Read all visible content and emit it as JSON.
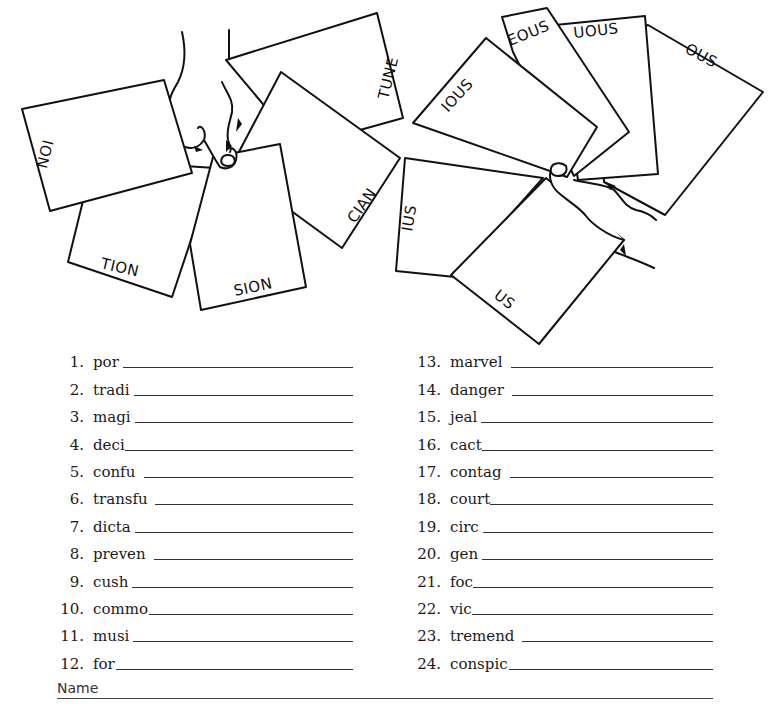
{
  "illustration": {
    "left_hand_cards": [
      "ION",
      "TION",
      "SION",
      "CIAN",
      "TUNE"
    ],
    "right_hand_cards": [
      "IOUS",
      "EOUS",
      "UOUS",
      "OUS",
      "IUS",
      "US"
    ]
  },
  "exercise": {
    "left_column": [
      {
        "num": "1.",
        "stem": "por"
      },
      {
        "num": "2.",
        "stem": "tradi"
      },
      {
        "num": "3.",
        "stem": "magi"
      },
      {
        "num": "4.",
        "stem": "deci"
      },
      {
        "num": "5.",
        "stem": "confu"
      },
      {
        "num": "6.",
        "stem": "transfu"
      },
      {
        "num": "7.",
        "stem": "dicta"
      },
      {
        "num": "8.",
        "stem": "preven"
      },
      {
        "num": "9.",
        "stem": "cush"
      },
      {
        "num": "10.",
        "stem": "commo"
      },
      {
        "num": "11.",
        "stem": "musi"
      },
      {
        "num": "12.",
        "stem": "for"
      }
    ],
    "right_column": [
      {
        "num": "13.",
        "stem": "marvel"
      },
      {
        "num": "14.",
        "stem": "danger"
      },
      {
        "num": "15.",
        "stem": "jeal"
      },
      {
        "num": "16.",
        "stem": "cact"
      },
      {
        "num": "17.",
        "stem": "contag"
      },
      {
        "num": "18.",
        "stem": "court"
      },
      {
        "num": "19.",
        "stem": "circ"
      },
      {
        "num": "20.",
        "stem": "gen"
      },
      {
        "num": "21.",
        "stem": "foc"
      },
      {
        "num": "22.",
        "stem": "vic"
      },
      {
        "num": "23.",
        "stem": "tremend"
      },
      {
        "num": "24.",
        "stem": "conspic"
      }
    ]
  },
  "footer": {
    "name_label": "Name"
  }
}
